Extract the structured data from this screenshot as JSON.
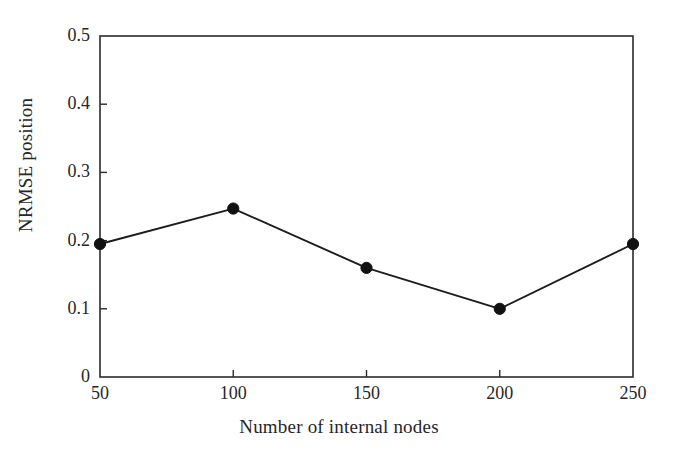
{
  "chart_data": {
    "type": "line",
    "title": "",
    "subtitle": "",
    "xlabel": "Number of internal nodes",
    "ylabel": "NRMSE position",
    "x": [
      50,
      100,
      150,
      200,
      250
    ],
    "values": [
      0.195,
      0.247,
      0.16,
      0.1,
      0.195
    ],
    "series": [
      {
        "name": "NRMSE position",
        "values": [
          0.195,
          0.247,
          0.16,
          0.1,
          0.195
        ]
      }
    ],
    "xlim": [
      50,
      250
    ],
    "ylim": [
      0,
      0.5
    ],
    "xticks": [
      50,
      100,
      150,
      200,
      250
    ],
    "yticks": [
      0,
      0.1,
      0.2,
      0.3,
      0.4,
      0.5
    ],
    "xtick_labels": [
      "50",
      "100",
      "150",
      "200",
      "250"
    ],
    "ytick_labels": [
      "0",
      "0.1",
      "0.2",
      "0.3",
      "0.4",
      "0.5"
    ],
    "grid": false,
    "legend": null,
    "legend_position": "none",
    "marker": "filled-circle",
    "line_color": "#1c1c1c",
    "marker_color": "#111111",
    "background_color": "#ffffff",
    "annotations": []
  }
}
